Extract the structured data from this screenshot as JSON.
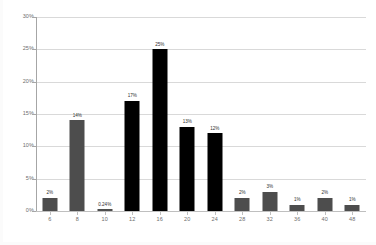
{
  "chart_data": {
    "type": "bar",
    "title": "",
    "xlabel": "",
    "ylabel": "",
    "categories": [
      "6",
      "8",
      "10",
      "12",
      "16",
      "20",
      "24",
      "28",
      "32",
      "36",
      "40",
      "48"
    ],
    "values": [
      2,
      14,
      0.24,
      17,
      25,
      13,
      12,
      2,
      3,
      1,
      2,
      1
    ],
    "data_labels": [
      "2%",
      "14%",
      "0.24%",
      "17%",
      "25%",
      "13%",
      "12%",
      "2%",
      "3%",
      "1%",
      "2%",
      "1%"
    ],
    "bar_colors": [
      "#4d4d4d",
      "#4d4d4d",
      "#4d4d4d",
      "#000000",
      "#000000",
      "#000000",
      "#000000",
      "#4d4d4d",
      "#4d4d4d",
      "#4d4d4d",
      "#4d4d4d",
      "#4d4d4d"
    ],
    "ylim": [
      0,
      30
    ],
    "ytick_values": [
      0,
      5,
      10,
      15,
      20,
      25,
      30
    ],
    "ytick_labels": [
      "0%",
      "5%",
      "10%",
      "15%",
      "20%",
      "25%",
      "30%"
    ],
    "grid": true,
    "grid_axis": "y",
    "legend": null,
    "legend_position": "none",
    "accent_color": "#000000",
    "secondary_color": "#4d4d4d",
    "gridline_color": "#d9d9d9",
    "axis_color": "#a6a6a6",
    "tick_label_color": "#6e6e6e",
    "background": "#ffffff"
  }
}
